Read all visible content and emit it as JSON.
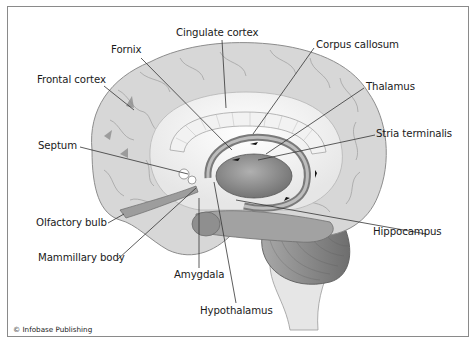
{
  "figure": {
    "credit": "© Infobase Publishing",
    "labels": {
      "cingulate_cortex": "Cingulate cortex",
      "fornix": "Fornix",
      "corpus_callosum": "Corpus callosum",
      "frontal_cortex": "Frontal cortex",
      "thalamus": "Thalamus",
      "stria_terminalis": "Stria terminalis",
      "septum": "Septum",
      "olfactory_bulb": "Olfactory bulb",
      "hippocampus": "Hippocampus",
      "mammillary_body": "Mammillary body",
      "amygdala": "Amygdala",
      "hypothalamus": "Hypothalamus"
    },
    "colors": {
      "frame": "#8a8a8a",
      "cortex": "#d6d6d6",
      "cortex_dark": "#b4b4b4",
      "limbic_dark": "#7d7d7d",
      "cerebellum": "#8c8c8c",
      "brainstem": "#e4e4e4",
      "leader_line": "#333333"
    }
  }
}
